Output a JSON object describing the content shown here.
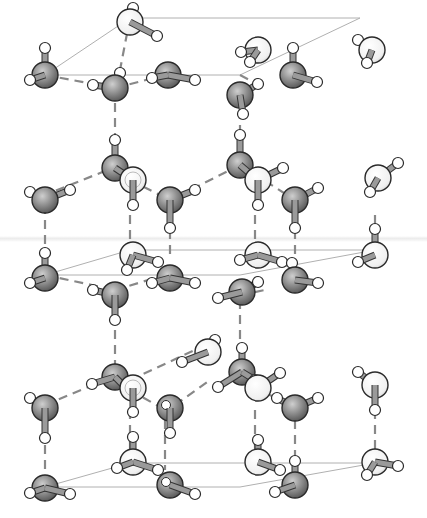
{
  "figure": {
    "width": 427,
    "height": 518,
    "colors": {
      "background": "#ffffff",
      "oxygen_dark_fill": "#8a8a8a",
      "oxygen_dark_highlight": "#c8c8c8",
      "oxygen_light_fill": "#f2f2f2",
      "hydrogen_fill": "#ffffff",
      "outline": "#2a2a2a",
      "covalent_bond": "#9a9a9a",
      "hydrogen_bond": "#888888",
      "cell_edge": "#b0b0b0"
    },
    "cell_edges": [
      [
        45,
        75,
        130,
        18
      ],
      [
        130,
        18,
        360,
        18
      ],
      [
        45,
        75,
        240,
        75
      ],
      [
        240,
        75,
        360,
        18
      ],
      [
        45,
        275,
        130,
        250
      ],
      [
        130,
        250,
        375,
        250
      ],
      [
        45,
        275,
        240,
        275
      ],
      [
        240,
        275,
        375,
        250
      ],
      [
        45,
        487,
        130,
        463
      ],
      [
        130,
        463,
        375,
        463
      ],
      [
        45,
        487,
        240,
        487
      ],
      [
        240,
        487,
        375,
        463
      ]
    ],
    "hbonds": [
      [
        45,
        75,
        115,
        88
      ],
      [
        115,
        88,
        165,
        75
      ],
      [
        240,
        75,
        265,
        88
      ],
      [
        130,
        18,
        120,
        70
      ],
      [
        115,
        88,
        115,
        160
      ],
      [
        240,
        95,
        240,
        160
      ],
      [
        120,
        165,
        45,
        195
      ],
      [
        240,
        165,
        170,
        200
      ],
      [
        130,
        180,
        170,
        200
      ],
      [
        240,
        165,
        295,
        200
      ],
      [
        45,
        205,
        45,
        260
      ],
      [
        130,
        215,
        130,
        260
      ],
      [
        170,
        215,
        170,
        260
      ],
      [
        255,
        215,
        255,
        260
      ],
      [
        295,
        215,
        295,
        260
      ],
      [
        375,
        215,
        375,
        225
      ],
      [
        45,
        275,
        115,
        290
      ],
      [
        115,
        290,
        165,
        275
      ],
      [
        240,
        295,
        265,
        290
      ],
      [
        115,
        300,
        115,
        370
      ],
      [
        240,
        300,
        240,
        350
      ],
      [
        45,
        405,
        105,
        380
      ],
      [
        130,
        380,
        195,
        350
      ],
      [
        130,
        390,
        165,
        410
      ],
      [
        240,
        380,
        290,
        405
      ],
      [
        175,
        405,
        210,
        380
      ],
      [
        45,
        415,
        45,
        470
      ],
      [
        130,
        410,
        130,
        460
      ],
      [
        165,
        420,
        165,
        470
      ],
      [
        255,
        410,
        255,
        460
      ],
      [
        295,
        420,
        295,
        470
      ],
      [
        375,
        410,
        375,
        455
      ]
    ],
    "molecules": [
      {
        "id": "w1",
        "o": [
          45,
          75
        ],
        "type": "dark",
        "h": [
          [
            45,
            48
          ],
          [
            30,
            80
          ]
        ]
      },
      {
        "id": "w2",
        "o": [
          130,
          22
        ],
        "type": "light",
        "h": [
          [
            133,
            8
          ],
          [
            157,
            36
          ]
        ]
      },
      {
        "id": "w3",
        "o": [
          115,
          88
        ],
        "type": "dark",
        "h": [
          [
            93,
            85
          ],
          [
            120,
            73
          ]
        ]
      },
      {
        "id": "w4",
        "o": [
          168,
          75
        ],
        "type": "dark",
        "h": [
          [
            195,
            80
          ],
          [
            152,
            78
          ]
        ]
      },
      {
        "id": "w5",
        "o": [
          258,
          50
        ],
        "type": "light",
        "h": [
          [
            241,
            52
          ],
          [
            250,
            62
          ]
        ]
      },
      {
        "id": "w6",
        "o": [
          240,
          95
        ],
        "type": "dark",
        "h": [
          [
            243,
            114
          ],
          [
            258,
            84
          ]
        ]
      },
      {
        "id": "w7",
        "o": [
          293,
          75
        ],
        "type": "dark",
        "h": [
          [
            293,
            48
          ],
          [
            317,
            82
          ]
        ]
      },
      {
        "id": "w8",
        "o": [
          372,
          50
        ],
        "type": "light",
        "h": [
          [
            358,
            40
          ],
          [
            367,
            63
          ]
        ]
      },
      {
        "id": "w9",
        "o": [
          115,
          168
        ],
        "type": "dark",
        "h": [
          [
            115,
            140
          ],
          [
            133,
            180
          ]
        ]
      },
      {
        "id": "w10",
        "o": [
          133,
          180
        ],
        "type": "light-ring",
        "h": [
          [
            133,
            205
          ]
        ]
      },
      {
        "id": "w11",
        "o": [
          45,
          200
        ],
        "type": "dark",
        "h": [
          [
            30,
            192
          ],
          [
            70,
            190
          ]
        ]
      },
      {
        "id": "w12",
        "o": [
          170,
          200
        ],
        "type": "dark",
        "h": [
          [
            170,
            228
          ],
          [
            195,
            190
          ]
        ]
      },
      {
        "id": "w13",
        "o": [
          240,
          165
        ],
        "type": "dark",
        "h": [
          [
            240,
            135
          ],
          [
            255,
            178
          ]
        ]
      },
      {
        "id": "w14",
        "o": [
          258,
          180
        ],
        "type": "light",
        "h": [
          [
            283,
            168
          ],
          [
            258,
            205
          ]
        ]
      },
      {
        "id": "w15",
        "o": [
          295,
          200
        ],
        "type": "dark",
        "h": [
          [
            318,
            188
          ],
          [
            295,
            228
          ]
        ]
      },
      {
        "id": "w16",
        "o": [
          378,
          178
        ],
        "type": "light",
        "h": [
          [
            398,
            163
          ],
          [
            370,
            192
          ]
        ]
      },
      {
        "id": "w17",
        "o": [
          45,
          278
        ],
        "type": "dark",
        "h": [
          [
            45,
            253
          ],
          [
            30,
            283
          ]
        ]
      },
      {
        "id": "w18",
        "o": [
          133,
          255
        ],
        "type": "light",
        "h": [
          [
            158,
            262
          ],
          [
            127,
            270
          ]
        ]
      },
      {
        "id": "w19",
        "o": [
          115,
          295
        ],
        "type": "dark",
        "h": [
          [
            93,
            290
          ],
          [
            115,
            320
          ]
        ]
      },
      {
        "id": "w20",
        "o": [
          170,
          278
        ],
        "type": "dark",
        "h": [
          [
            152,
            283
          ],
          [
            195,
            283
          ]
        ]
      },
      {
        "id": "w21",
        "o": [
          258,
          255
        ],
        "type": "light",
        "h": [
          [
            240,
            260
          ],
          [
            282,
            262
          ]
        ]
      },
      {
        "id": "w22",
        "o": [
          242,
          292
        ],
        "type": "dark",
        "h": [
          [
            258,
            282
          ],
          [
            218,
            298
          ]
        ]
      },
      {
        "id": "w23",
        "o": [
          295,
          280
        ],
        "type": "dark",
        "h": [
          [
            318,
            283
          ],
          [
            292,
            263
          ]
        ]
      },
      {
        "id": "w24",
        "o": [
          375,
          255
        ],
        "type": "light",
        "h": [
          [
            375,
            229
          ],
          [
            358,
            262
          ]
        ]
      },
      {
        "id": "w25",
        "o": [
          115,
          377
        ],
        "type": "dark",
        "h": [
          [
            92,
            384
          ],
          [
            128,
            390
          ]
        ]
      },
      {
        "id": "w26",
        "o": [
          133,
          388
        ],
        "type": "light-ring",
        "h": [
          [
            133,
            412
          ]
        ]
      },
      {
        "id": "w27",
        "o": [
          45,
          408
        ],
        "type": "dark",
        "h": [
          [
            30,
            398
          ],
          [
            45,
            438
          ]
        ]
      },
      {
        "id": "w28",
        "o": [
          208,
          352
        ],
        "type": "light",
        "h": [
          [
            182,
            362
          ],
          [
            215,
            340
          ]
        ]
      },
      {
        "id": "w29",
        "o": [
          170,
          408
        ],
        "type": "dark-hole",
        "h": [
          [
            170,
            433
          ],
          [
            165,
            405
          ]
        ]
      },
      {
        "id": "w30",
        "o": [
          242,
          372
        ],
        "type": "dark",
        "h": [
          [
            242,
            348
          ],
          [
            218,
            387
          ],
          [
            255,
            380
          ]
        ]
      },
      {
        "id": "w31",
        "o": [
          258,
          388
        ],
        "type": "light",
        "h": [
          [
            280,
            373
          ]
        ]
      },
      {
        "id": "w32",
        "o": [
          295,
          408
        ],
        "type": "dark",
        "h": [
          [
            318,
            398
          ],
          [
            277,
            398
          ]
        ]
      },
      {
        "id": "w33",
        "o": [
          375,
          385
        ],
        "type": "light",
        "h": [
          [
            358,
            372
          ],
          [
            375,
            410
          ]
        ]
      },
      {
        "id": "w34",
        "o": [
          45,
          488
        ],
        "type": "dark",
        "h": [
          [
            30,
            493
          ],
          [
            70,
            494
          ]
        ]
      },
      {
        "id": "w35",
        "o": [
          133,
          462
        ],
        "type": "light",
        "h": [
          [
            133,
            437
          ],
          [
            158,
            470
          ],
          [
            117,
            468
          ]
        ]
      },
      {
        "id": "w36",
        "o": [
          170,
          485
        ],
        "type": "dark-hole",
        "h": [
          [
            195,
            494
          ]
        ]
      },
      {
        "id": "w37",
        "o": [
          258,
          462
        ],
        "type": "light",
        "h": [
          [
            280,
            470
          ],
          [
            258,
            440
          ]
        ]
      },
      {
        "id": "w38",
        "o": [
          295,
          485
        ],
        "type": "dark",
        "h": [
          [
            295,
            461
          ],
          [
            275,
            492
          ]
        ]
      },
      {
        "id": "w39",
        "o": [
          375,
          462
        ],
        "type": "light",
        "h": [
          [
            398,
            466
          ],
          [
            367,
            475
          ]
        ]
      }
    ]
  }
}
